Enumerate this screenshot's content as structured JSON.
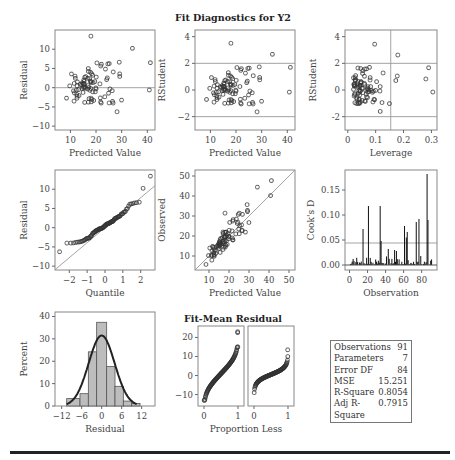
{
  "figure": {
    "title": "Fit Diagnostics for Y2",
    "fit_mean_title": "Fit-Mean Residual"
  },
  "stats": [
    {
      "label": "Observations",
      "value": "91"
    },
    {
      "label": "Parameters",
      "value": "7"
    },
    {
      "label": "Error DF",
      "value": "84"
    },
    {
      "label": "MSE",
      "value": "15.251"
    },
    {
      "label": "R-Square",
      "value": "0.8054"
    },
    {
      "label": "Adj R-Square",
      "value": "0.7915"
    }
  ],
  "chart_data": [
    {
      "id": "residual-vs-predicted",
      "type": "scatter",
      "title": "",
      "xlabel": "Predicted Value",
      "ylabel": "Residual",
      "xlim": [
        4,
        43
      ],
      "ylim": [
        -11,
        15
      ],
      "xticks": [
        10,
        20,
        30,
        40
      ],
      "yticks": [
        -10,
        -5,
        0,
        5,
        10
      ],
      "reference_lines_y": [
        0
      ],
      "points_seed": 11,
      "n": 91
    },
    {
      "id": "rstudent-vs-predicted",
      "type": "scatter",
      "title": "Fit Diagnostics for Y2",
      "xlabel": "Predicted Value",
      "ylabel": "RStudent",
      "xlim": [
        4,
        43
      ],
      "ylim": [
        -3,
        4.5
      ],
      "xticks": [
        10,
        20,
        30,
        40
      ],
      "yticks": [
        -2,
        0,
        2,
        4
      ],
      "reference_lines_y": [
        -2,
        2
      ],
      "points_seed": 12,
      "n": 91
    },
    {
      "id": "rstudent-vs-leverage",
      "type": "scatter",
      "xlabel": "Leverage",
      "ylabel": "RStudent",
      "xlim": [
        -0.01,
        0.32
      ],
      "ylim": [
        -3,
        4.5
      ],
      "xticks": [
        0.0,
        0.1,
        0.2,
        0.3
      ],
      "ytick_labels": [
        "-2",
        "0",
        "2",
        "4"
      ],
      "yticks": [
        -2,
        0,
        2,
        4
      ],
      "reference_lines_y": [
        -2,
        2
      ],
      "reference_lines_x": [
        0.154
      ],
      "points_seed": 13,
      "n": 91
    },
    {
      "id": "qq-plot",
      "type": "scatter",
      "xlabel": "Quantile",
      "ylabel": "Residual",
      "xlim": [
        -2.8,
        2.8
      ],
      "ylim": [
        -11,
        15
      ],
      "xticks": [
        -2,
        -1,
        0,
        1,
        2
      ],
      "yticks": [
        -10,
        -5,
        0,
        5,
        10
      ],
      "reference_line": {
        "intercept": 0,
        "slope": 3.9
      },
      "points_seed": 14,
      "n": 91
    },
    {
      "id": "observed-vs-predicted",
      "type": "scatter",
      "xlabel": "Predicted Value",
      "ylabel": "Observed",
      "xlim": [
        3,
        53
      ],
      "ylim": [
        3,
        53
      ],
      "xticks": [
        10,
        20,
        30,
        40,
        50
      ],
      "yticks": [
        10,
        20,
        30,
        40,
        50
      ],
      "reference_line": {
        "intercept": 0,
        "slope": 1
      },
      "points_seed": 15,
      "n": 91
    },
    {
      "id": "cooks-d",
      "type": "bar",
      "xlabel": "Observation",
      "ylabel": "Cook's D",
      "xlim": [
        -5,
        97
      ],
      "ylim": [
        -0.01,
        0.19
      ],
      "xticks": [
        0,
        20,
        40,
        60,
        80
      ],
      "yticks": [
        0.0,
        0.05,
        0.1,
        0.15
      ],
      "ytick_labels": [
        "0.00",
        "0.05",
        "0.10",
        "0.15"
      ],
      "reference_lines_y": [
        0.044
      ],
      "large_values": [
        [
          15,
          0.072
        ],
        [
          21,
          0.118
        ],
        [
          34,
          0.118
        ],
        [
          35,
          0.048
        ],
        [
          43,
          0.032
        ],
        [
          50,
          0.03
        ],
        [
          52,
          0.028
        ],
        [
          61,
          0.078
        ],
        [
          63,
          0.055
        ],
        [
          64,
          0.066
        ],
        [
          74,
          0.086
        ],
        [
          77,
          0.092
        ],
        [
          86,
          0.182
        ],
        [
          87,
          0.09
        ]
      ]
    },
    {
      "id": "residual-histogram",
      "type": "bar",
      "xlabel": "Residual",
      "ylabel": "Percent",
      "xlim": [
        -14,
        16
      ],
      "ylim": [
        0,
        42
      ],
      "xticks": [
        -12,
        -6,
        0,
        6,
        12
      ],
      "yticks": [
        0,
        10,
        20,
        30,
        40
      ],
      "bin_edges": [
        -10.5,
        -6.5,
        -4,
        -1.5,
        1.5,
        4,
        6.5,
        9,
        11.5,
        13
      ],
      "percents": [
        3.3,
        5.5,
        24.2,
        37.4,
        17.6,
        8.8,
        2.2,
        1.1,
        0
      ],
      "normal_curve": {
        "mean": 0,
        "sd": 3.9,
        "peak": 31.5
      }
    },
    {
      "id": "fit-mean-residual",
      "type": "scatter",
      "title": "Fit-Mean Residual",
      "xlabel": "Proportion Less",
      "ylabel": "",
      "ylim": [
        -16,
        26
      ],
      "yticks": [
        -10,
        0,
        10,
        20
      ],
      "panels": [
        {
          "name": "Fit-Mean",
          "xticks": [
            0,
            1
          ],
          "min": -13,
          "max": 15,
          "outliers": [
            22.5,
            23
          ]
        },
        {
          "name": "Residual",
          "xticks": [
            0,
            1
          ],
          "min": -9,
          "max": 10,
          "outliers": [
            13.5
          ]
        }
      ]
    }
  ]
}
